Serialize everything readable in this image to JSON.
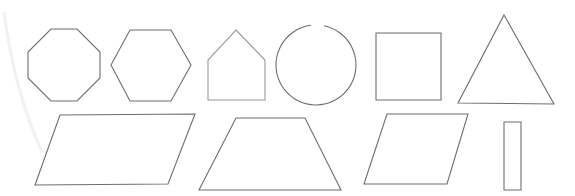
{
  "canvas": {
    "width": 575,
    "height": 196,
    "background": "#ffffff"
  },
  "colors": {
    "stroke": "#6e6e6e",
    "stroke_light": "#9a9a9a",
    "artifact": "#f1f1f1"
  },
  "shapes": [
    {
      "id": "octagon",
      "type": "polygon",
      "label": "octagon",
      "points": "51,29 77,29 100,52 100,78 77,101 51,101 28,78 28,52"
    },
    {
      "id": "hexagon",
      "type": "polygon",
      "label": "hexagon",
      "points": "130,30 171,30 191,65 171,101 130,101 111,65"
    },
    {
      "id": "pentagon",
      "type": "polygon",
      "label": "pentagon",
      "points": "236,30 265,60 265,100 208,100 208,60",
      "light": true
    },
    {
      "id": "circle",
      "type": "arc",
      "label": "circle",
      "cx": 316,
      "cy": 65,
      "r": 40,
      "gap_start_x": 311,
      "gap_end_x": 324
    },
    {
      "id": "square",
      "type": "polygon",
      "label": "square",
      "points": "376,33 441,33 441,100 376,100"
    },
    {
      "id": "triangle",
      "type": "polygon",
      "label": "triangle",
      "points": "504,15 554,104 458,103"
    },
    {
      "id": "parallelogram-large",
      "type": "polygon",
      "label": "parallelogram",
      "points": "60,115 195,114 168,184 35,185"
    },
    {
      "id": "trapezoid",
      "type": "polygon",
      "label": "trapezoid",
      "points": "236,118 305,118 341,190 199,190"
    },
    {
      "id": "parallelogram-small",
      "type": "polygon",
      "label": "rhombus",
      "points": "387,114 468,114 447,184 364,184"
    },
    {
      "id": "rectangle",
      "type": "polygon",
      "label": "rectangle",
      "points": "504,122 521,122 521,190 504,190"
    }
  ],
  "artifact": {
    "path": "M 4 12 Q 14 90 42 152"
  }
}
